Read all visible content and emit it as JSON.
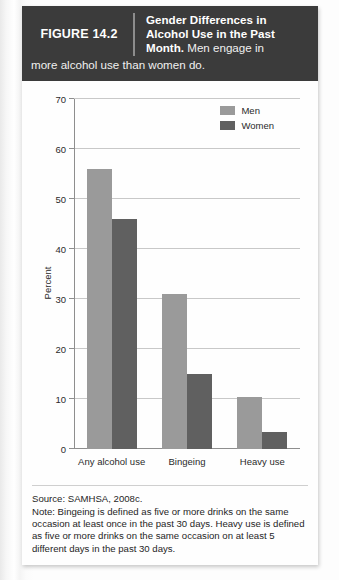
{
  "figure": {
    "number_label": "FIGURE 14.2",
    "title_bold": "Gender Differences in Alcohol Use in the Past Month.",
    "title_regular": " Men engage in",
    "caption_tail": "more alcohol use than women do."
  },
  "footnote": {
    "source": "Source: SAMHSA, 2008c.",
    "note": "Note: Bingeing is defined as five or more drinks on the same occasion at least once in the past 30 days. Heavy use is defined as five or more drinks on the same occasion on at least 5 different days in the past 30 days."
  },
  "colors": {
    "men": "#9a9a9a",
    "women": "#606060",
    "header_bg": "#3b3b3b",
    "gridline": "#c8c8c8",
    "axis": "#8e8e8e"
  },
  "chart_data": {
    "type": "bar",
    "title": "Gender Differences in Alcohol Use in the Past Month",
    "categories": [
      "Any alcohol use",
      "Bingeing",
      "Heavy use"
    ],
    "series": [
      {
        "name": "Men",
        "values": [
          56,
          31,
          10.5
        ],
        "color": "#9a9a9a"
      },
      {
        "name": "Women",
        "values": [
          46,
          15,
          3.5
        ],
        "color": "#606060"
      }
    ],
    "xlabel": "",
    "ylabel": "Percent",
    "ylim": [
      0,
      70
    ],
    "yticks": [
      0,
      10,
      20,
      30,
      40,
      50,
      60,
      70
    ],
    "ytick_labels": [
      "0",
      "10",
      "20",
      "30",
      "40",
      "50",
      "60",
      "70"
    ],
    "grid": "horizontal",
    "legend_position": "top-right",
    "legend_entries": [
      "Men",
      "Women"
    ]
  }
}
